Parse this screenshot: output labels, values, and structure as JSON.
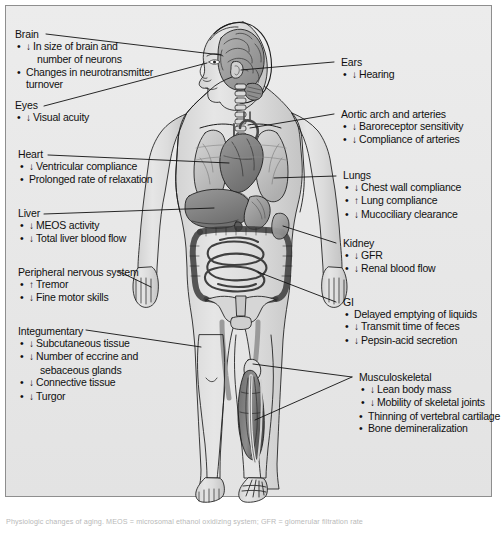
{
  "figure": {
    "title": "Physiologic changes of aging",
    "background_color": "#e9e9e9",
    "border_color": "#8e8e8e",
    "illustration": {
      "name": "anterior-human-body-anatomy",
      "description": "Anterior view of a human figure with head turned in profile, showing brain, heart, lungs, liver, intestines, pelvis and skeleton, with the right lower leg dissected to show muscle and bone",
      "organs": [
        "brain",
        "eye",
        "ear",
        "trachea",
        "heart",
        "lungs",
        "aortic arch",
        "liver",
        "stomach",
        "small intestine",
        "large intestine",
        "kidney",
        "pelvis",
        "femur",
        "tibia",
        "fibula",
        "calf muscle",
        "foot bones"
      ]
    }
  },
  "left_column": [
    {
      "id": "brain",
      "title": "Brain",
      "items": [
        {
          "arrow": "down",
          "text": "In size of brain and",
          "continuation": "number of neurons"
        },
        {
          "arrow": "none",
          "text": "Changes in neurotransmitter",
          "continuation": "turnover"
        }
      ]
    },
    {
      "id": "eyes",
      "title": "Eyes",
      "items": [
        {
          "arrow": "down",
          "text": "Visual acuity"
        }
      ]
    },
    {
      "id": "heart",
      "title": "Heart",
      "items": [
        {
          "arrow": "down",
          "text": "Ventricular compliance"
        },
        {
          "arrow": "none",
          "text": "Prolonged rate of relaxation"
        }
      ]
    },
    {
      "id": "liver",
      "title": "Liver",
      "items": [
        {
          "arrow": "down",
          "text": "MEOS activity"
        },
        {
          "arrow": "down",
          "text": "Total liver blood flow"
        }
      ]
    },
    {
      "id": "peripheral-nervous-system",
      "title": "Peripheral nervous system",
      "items": [
        {
          "arrow": "up",
          "text": "Tremor"
        },
        {
          "arrow": "down",
          "text": "Fine motor skills"
        }
      ]
    },
    {
      "id": "integumentary",
      "title": "Integumentary",
      "items": [
        {
          "arrow": "down",
          "text": "Subcutaneous tissue"
        },
        {
          "arrow": "down",
          "text": "Number of eccrine and",
          "continuation": "sebaceous glands"
        },
        {
          "arrow": "down",
          "text": "Connective tissue"
        },
        {
          "arrow": "down",
          "text": "Turgor"
        }
      ]
    }
  ],
  "right_column": [
    {
      "id": "ears",
      "title": "Ears",
      "items": [
        {
          "arrow": "down",
          "text": "Hearing"
        }
      ]
    },
    {
      "id": "aortic-arch-and-arteries",
      "title": "Aortic arch and arteries",
      "items": [
        {
          "arrow": "down",
          "text": "Baroreceptor sensitivity"
        },
        {
          "arrow": "down",
          "text": "Compliance of arteries"
        }
      ]
    },
    {
      "id": "lungs",
      "title": "Lungs",
      "items": [
        {
          "arrow": "down",
          "text": "Chest wall compliance"
        },
        {
          "arrow": "up",
          "text": "Lung compliance"
        },
        {
          "arrow": "down",
          "text": "Mucociliary clearance"
        }
      ]
    },
    {
      "id": "kidney",
      "title": "Kidney",
      "items": [
        {
          "arrow": "down",
          "text": "GFR"
        },
        {
          "arrow": "down",
          "text": "Renal blood flow"
        }
      ]
    },
    {
      "id": "gi",
      "title": "GI",
      "items": [
        {
          "arrow": "none",
          "text": "Delayed emptying of liquids"
        },
        {
          "arrow": "down",
          "text": "Transmit time of feces"
        },
        {
          "arrow": "down",
          "text": "Pepsin-acid secretion"
        }
      ]
    },
    {
      "id": "musculoskeletal",
      "title": "Musculoskeletal",
      "items": [
        {
          "arrow": "down",
          "text": "Lean body mass"
        },
        {
          "arrow": "down",
          "text": "Mobility of skeletal joints"
        },
        {
          "arrow": "none",
          "text": "Thinning of vertebral cartilage"
        },
        {
          "arrow": "none",
          "text": "Bone demineralization"
        }
      ]
    }
  ],
  "glyphs": {
    "bullet": "•",
    "arrow_down": "↓",
    "arrow_up": "↑"
  },
  "caption": {
    "text": "Physiologic changes of aging. MEOS = microsomal ethanol oxidizing system; GFR = glomerular filtration rate"
  }
}
